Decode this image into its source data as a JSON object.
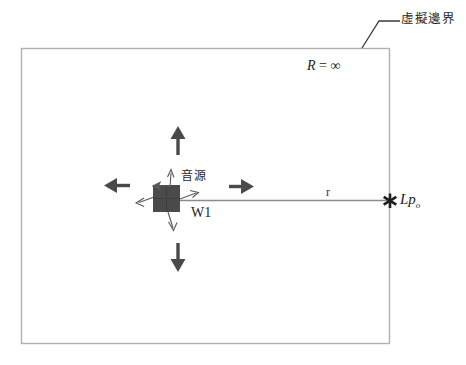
{
  "diagram": {
    "title_label": "虛擬邊界",
    "boundary_radius_label": "R = ∞",
    "boundary_radius_symbol": "R",
    "boundary_radius_equals": "=",
    "boundary_radius_value": "∞",
    "source_label": "音源",
    "source_power_label": "W1",
    "distance_label": "r",
    "receiver_label": "Lp",
    "receiver_label_sub": "o",
    "receiver_marker": "asterisk-marker",
    "colors": {
      "boundary_stroke": "#b0b0b0",
      "leader_stroke": "#3a3a3a",
      "arrow_fill": "#4a4a4a",
      "source_block": "#4a4a4a",
      "distance_line": "#8c8c8c",
      "text": "#242424"
    },
    "arrows": [
      {
        "name": "arrow-up",
        "direction": "up"
      },
      {
        "name": "arrow-down",
        "direction": "down"
      },
      {
        "name": "arrow-left",
        "direction": "left"
      },
      {
        "name": "arrow-right",
        "direction": "right"
      },
      {
        "name": "radiation-arrow-up",
        "direction": "up"
      },
      {
        "name": "radiation-arrow-down",
        "direction": "down"
      },
      {
        "name": "radiation-arrow-left",
        "direction": "left"
      },
      {
        "name": "radiation-arrow-right",
        "direction": "right"
      }
    ]
  }
}
